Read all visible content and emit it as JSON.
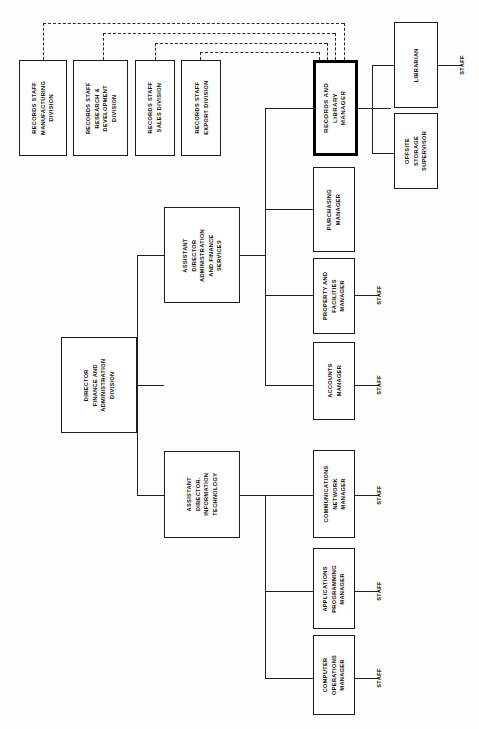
{
  "chart": {
    "type": "org-chart",
    "title": "",
    "orientation": "rotated-90",
    "root": "DIRECTOR FINANCE AND ADMINISTRATION DIVISION",
    "highlighted_node": "RECORDS AND LIBRARY MANAGER"
  },
  "nodes": {
    "director": {
      "label": "DIRECTOR\nFINANCE AND\nADMINISTRATION\nDIVISION",
      "lines": [
        "DIRECTOR",
        "FINANCE AND",
        "ADMINISTRATION",
        "DIVISION"
      ]
    },
    "asst_admin": {
      "label": "ASSISTANT\nDIRECTOR\nADMINISTRATION\nAND FINANCE\nSERVICES",
      "lines": [
        "ASSISTANT",
        "DIRECTOR",
        "ADMINISTRATION",
        "AND FINANCE",
        "SERVICES"
      ]
    },
    "asst_it": {
      "label": "ASSISTANT\nDIRECTOR.\nINFORMATION\nTECHNOLOGY",
      "lines": [
        "ASSISTANT",
        "DIRECTOR.",
        "INFORMATION",
        "TECHNOLOGY"
      ]
    },
    "records_library_manager": {
      "label": "RECORDS AND\nLIBRARY\nMANAGER",
      "lines": [
        "RECORDS AND",
        "LIBRARY",
        "MANAGER"
      ]
    },
    "purchasing_manager": {
      "label": "PURCHASING\nMANAGER",
      "lines": [
        "PURCHASING",
        "MANAGER"
      ]
    },
    "property_manager": {
      "label": "PROPERTY AND\nFACILITIES\nMANAGER",
      "lines": [
        "PROPERTY AND",
        "FACILITIES",
        "MANAGER"
      ]
    },
    "accounts_manager": {
      "label": "ACCOUNTS\nMANAGER",
      "lines": [
        "ACCOUNTS",
        "MANAGER"
      ]
    },
    "comms_manager": {
      "label": "COMMUNICATIONS\nNETWORK\nMANAGER",
      "lines": [
        "COMMUNICATIONS",
        "NETWORK",
        "MANAGER"
      ]
    },
    "apps_manager": {
      "label": "APPLICATIONS\nPROGRAMMING\nMANAGER",
      "lines": [
        "APPLICATIONS",
        "PROGRAMMING",
        "MANAGER"
      ]
    },
    "computer_ops_manager": {
      "label": "COMPUTER\nOPERATIONS\nMANAGER",
      "lines": [
        "COMPUTER",
        "OPERATIONS",
        "MANAGER"
      ]
    },
    "librarian": {
      "label": "LIBRARIAN",
      "lines": [
        "LIBRARIAN"
      ]
    },
    "offsite_supervisor": {
      "label": "OFFSITE\nSTORAGE\nSUPERVISOR",
      "lines": [
        "OFFSITE",
        "STORAGE",
        "SUPERVISOR"
      ]
    },
    "records_manufacturing": {
      "label": "RECORDS STAFF\nMANUFACTURING\nDIVISION",
      "lines": [
        "RECORDS STAFF",
        "MANUFACTURING",
        "DIVISION"
      ]
    },
    "records_rd": {
      "label": "RECORDS STAFF\nRESEARCH &\nDEVELOPMENT\nDIVISION",
      "lines": [
        "RECORDS STAFF",
        "RESEARCH &",
        "DEVELOPMENT",
        "DIVISION"
      ]
    },
    "records_sales": {
      "label": "RECORDS STAFF\nSALES DIVISION",
      "lines": [
        "RECORDS STAFF",
        "SALES DIVISION"
      ]
    },
    "records_export": {
      "label": "RECORDS STAFF\nEXPORT DIVISION",
      "lines": [
        "RECORDS STAFF",
        "EXPORT DIVISION"
      ]
    }
  },
  "staff_labels": {
    "librarian_staff": "STAFF",
    "property_staff": "STAFF",
    "accounts_staff": "STAFF",
    "comms_staff": "STAFF",
    "apps_staff": "STAFF",
    "computer_ops_staff": "STAFF"
  },
  "colors": {
    "line": "#1f1f1f",
    "box_border": "#1c1c1c",
    "highlight_border": "#000000",
    "background": "#ffffff",
    "text": "#111111"
  }
}
